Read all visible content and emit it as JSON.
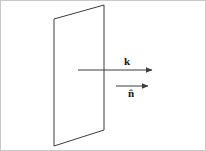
{
  "figure": {
    "background_color": "#ffffff",
    "border_color": "#c8c8c8",
    "stroke_color": "#3c3c3c",
    "label_color": "#141414",
    "labels": {
      "wave_vector": "k",
      "normal_vector": "n̂"
    },
    "shapes": {
      "plane": {
        "name": "surface-plane",
        "kind": "parallelogram",
        "points": "104,5 104,130 54,146 54,19"
      },
      "wave_vector_arrow": {
        "name": "wave-vector-arrow",
        "kind": "arrow",
        "x1": 78,
        "y1": 70,
        "x2": 155,
        "y2": 70
      },
      "normal_vector_arrow": {
        "name": "normal-vector-arrow",
        "kind": "arrow",
        "x1": 116,
        "y1": 86,
        "x2": 151,
        "y2": 86
      }
    }
  }
}
